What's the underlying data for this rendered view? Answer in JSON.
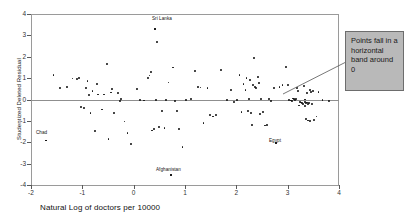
{
  "chart_data": {
    "type": "scatter",
    "title": "",
    "xlabel": "Natural Log of doctors per 10000",
    "ylabel": "Studentized Deleted Residual",
    "xlim": [
      -2,
      4
    ],
    "ylim": [
      -4,
      4
    ],
    "xticks": [
      -2,
      -1,
      0,
      1,
      2,
      3,
      4
    ],
    "xtick_labels": [
      "-2",
      "-1",
      "0",
      "1",
      "2",
      "3",
      "4"
    ],
    "yticks": [
      -4,
      -3,
      -2,
      -1,
      0,
      1,
      2,
      3,
      4
    ],
    "ytick_labels": [
      "-4",
      "-3",
      "-2",
      "-1",
      "0",
      "1",
      "2",
      "3",
      "4"
    ],
    "grid": false,
    "legend": null,
    "reference_line": {
      "orientation": "horizontal",
      "y": 0
    },
    "points": [
      [
        -1.71,
        -1.92
      ],
      [
        -1.56,
        1.14
      ],
      [
        -1.44,
        0.55
      ],
      [
        -1.3,
        0.58
      ],
      [
        -1.1,
        0.95
      ],
      [
        -1.06,
        1.0
      ],
      [
        -1.02,
        -0.34
      ],
      [
        -0.97,
        -0.38
      ],
      [
        -0.93,
        0.55
      ],
      [
        -0.9,
        0.88
      ],
      [
        -0.87,
        0.22
      ],
      [
        -0.84,
        -0.65
      ],
      [
        -0.8,
        0.38
      ],
      [
        -0.76,
        -1.48
      ],
      [
        -0.72,
        0.72
      ],
      [
        -0.69,
        0.23
      ],
      [
        -0.62,
        -0.47
      ],
      [
        -0.58,
        0.23
      ],
      [
        -0.52,
        1.67
      ],
      [
        -0.49,
        -1.85
      ],
      [
        -0.42,
        0.48
      ],
      [
        -0.38,
        -0.62
      ],
      [
        -0.31,
        0.3
      ],
      [
        -0.27,
        -0.08
      ],
      [
        -0.24,
        0.02
      ],
      [
        -0.18,
        -1.03
      ],
      [
        -0.12,
        -1.58
      ],
      [
        -0.05,
        -2.07
      ],
      [
        0.06,
        0.5
      ],
      [
        0.12,
        -0.03
      ],
      [
        0.2,
        -0.05
      ],
      [
        0.28,
        1.02
      ],
      [
        0.31,
        1.12
      ],
      [
        0.33,
        1.28
      ],
      [
        0.36,
        -1.45
      ],
      [
        0.4,
        -1.38
      ],
      [
        0.42,
        3.28
      ],
      [
        0.44,
        -0.04
      ],
      [
        0.46,
        2.68
      ],
      [
        0.5,
        -1.28
      ],
      [
        0.55,
        -0.52
      ],
      [
        0.6,
        -1.33
      ],
      [
        0.63,
        -0.02
      ],
      [
        0.68,
        0.8
      ],
      [
        0.72,
        -3.55
      ],
      [
        0.76,
        1.5
      ],
      [
        0.8,
        -0.07
      ],
      [
        0.88,
        -1.37
      ],
      [
        0.95,
        -2.22
      ],
      [
        1.02,
        -0.02
      ],
      [
        1.12,
        0.04
      ],
      [
        1.2,
        1.32
      ],
      [
        1.3,
        0.56
      ],
      [
        1.36,
        -1.1
      ],
      [
        1.44,
        0.55
      ],
      [
        1.48,
        -0.73
      ],
      [
        1.55,
        -0.8
      ],
      [
        1.6,
        -0.74
      ],
      [
        1.7,
        1.38
      ],
      [
        1.82,
        -0.03
      ],
      [
        1.9,
        0.46
      ],
      [
        1.96,
        -0.13
      ],
      [
        2.02,
        -0.02
      ],
      [
        2.06,
        1.16
      ],
      [
        2.1,
        -0.58
      ],
      [
        2.14,
        0.72
      ],
      [
        2.18,
        0.46
      ],
      [
        2.2,
        1.02
      ],
      [
        2.22,
        -0.52
      ],
      [
        2.24,
        0.04
      ],
      [
        2.26,
        0.9
      ],
      [
        2.28,
        -0.62
      ],
      [
        2.3,
        -1.18
      ],
      [
        2.32,
        0.68
      ],
      [
        2.34,
        1.95
      ],
      [
        2.36,
        0.6
      ],
      [
        2.38,
        0.53
      ],
      [
        2.42,
        1.05
      ],
      [
        2.46,
        -0.66
      ],
      [
        2.52,
        -0.58
      ],
      [
        2.56,
        -1.22
      ],
      [
        2.6,
        -1.2
      ],
      [
        2.64,
        0.02
      ],
      [
        2.68,
        -0.08
      ],
      [
        2.74,
        0.55
      ],
      [
        2.78,
        -2.05
      ],
      [
        2.84,
        0.6
      ],
      [
        2.9,
        0.66
      ],
      [
        2.96,
        1.52
      ],
      [
        3.0,
        0.66
      ],
      [
        3.02,
        -0.04
      ],
      [
        3.06,
        -0.05
      ],
      [
        3.1,
        0.05
      ],
      [
        3.12,
        0.03
      ],
      [
        3.14,
        -0.02
      ],
      [
        3.16,
        0.04
      ],
      [
        3.18,
        0.52
      ],
      [
        3.2,
        0.4
      ],
      [
        3.22,
        -0.28
      ],
      [
        3.24,
        -0.1
      ],
      [
        3.26,
        -0.14
      ],
      [
        3.28,
        -0.18
      ],
      [
        3.3,
        -0.22
      ],
      [
        3.32,
        0.62
      ],
      [
        3.34,
        -0.12
      ],
      [
        3.34,
        -0.3
      ],
      [
        3.36,
        -0.16
      ],
      [
        3.36,
        -0.9
      ],
      [
        3.38,
        -0.14
      ],
      [
        3.38,
        0.3
      ],
      [
        3.4,
        -0.2
      ],
      [
        3.4,
        -0.98
      ],
      [
        3.42,
        -0.17
      ],
      [
        3.44,
        0.45
      ],
      [
        3.44,
        -1.02
      ],
      [
        3.46,
        0.35
      ],
      [
        3.48,
        -0.22
      ],
      [
        3.5,
        0.4
      ],
      [
        3.52,
        -0.95
      ],
      [
        3.56,
        -0.8
      ],
      [
        3.6,
        0.36
      ],
      [
        3.68,
        -0.03
      ],
      [
        3.8,
        -0.06
      ],
      [
        -0.44,
        0.33
      ],
      [
        2.44,
        0.76
      ],
      [
        1.26,
        0.58
      ],
      [
        3.08,
        -0.07
      ],
      [
        2.48,
        0.04
      ],
      [
        0.85,
        -0.55
      ],
      [
        -1.19,
        0.98
      ],
      [
        3.33,
        0.0
      ]
    ],
    "annotated_points": [
      {
        "name": "Sri Lanka",
        "x": 0.42,
        "y": 3.28,
        "label_x": 152,
        "label_y": 17
      },
      {
        "name": "Chad",
        "x": -1.71,
        "y": -1.92,
        "label_x": 36,
        "label_y": 131
      },
      {
        "name": "Afghanistan",
        "x": 0.72,
        "y": -3.55,
        "label_x": 156,
        "label_y": 168
      },
      {
        "name": "Egypt",
        "x": 2.78,
        "y": -2.05,
        "label_x": 269,
        "label_y": 139
      }
    ]
  },
  "callout": {
    "text": "Points fall in a horizontal band around 0",
    "bg_color": "#b9b9b9",
    "border_color": "#6d6d6d",
    "leader_from": [
      283,
      94
    ],
    "leader_to": [
      345,
      62
    ]
  },
  "colors": {
    "point": "#111111",
    "axis": "#9a9a9a",
    "zero_line": "#8f8f8f",
    "text": "#1a1a1a"
  }
}
